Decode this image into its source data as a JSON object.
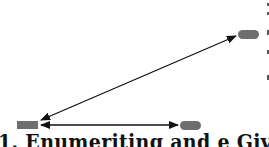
{
  "diagram": {
    "nodes": [
      {
        "id": "left",
        "shape": "rect",
        "color": "#6e6e6e",
        "x": 17,
        "y": 121,
        "w": 21,
        "h": 8
      },
      {
        "id": "bottom-right",
        "shape": "pill",
        "color": "#6e6e6e",
        "x": 180,
        "y": 121,
        "w": 21,
        "h": 9
      },
      {
        "id": "top-right",
        "shape": "pill",
        "color": "#6e6e6e",
        "x": 238,
        "y": 30,
        "w": 21,
        "h": 9
      }
    ],
    "edges": [
      {
        "from": "left",
        "to": "top-right",
        "type": "bidirectional-arrow"
      },
      {
        "from": "left",
        "to": "bottom-right",
        "type": "bidirectional-arrow"
      }
    ],
    "caption": "1. Enumeriting and e Giverv"
  }
}
